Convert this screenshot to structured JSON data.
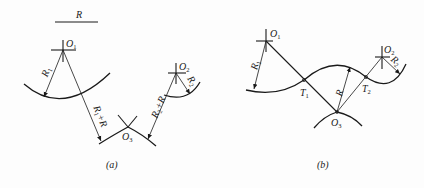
{
  "figure_a": {
    "caption": "(a)",
    "scale_bar_label": "R",
    "labels": {
      "O1": "O",
      "O1_sub": "1",
      "O2": "O",
      "O2_sub": "2",
      "O3": "O",
      "O3_sub": "3",
      "R1": "R",
      "R1_sub": "1",
      "R2": "R",
      "R2_sub": "2",
      "R1pR": "R",
      "R1pR_sub": "1",
      "R1pR_tail": "+R",
      "R2pR": "R",
      "R2pR_sub": "2",
      "R2pR_tail": "+R"
    }
  },
  "figure_b": {
    "caption": "(b)",
    "labels": {
      "O1": "O",
      "O1_sub": "1",
      "O2": "O",
      "O2_sub": "2",
      "O3": "O",
      "O3_sub": "3",
      "T1": "T",
      "T1_sub": "1",
      "T2": "T",
      "T2_sub": "2",
      "R1": "R",
      "R1_sub": "1",
      "R2": "R",
      "R2_sub": "2",
      "R": "R"
    }
  },
  "colors": {
    "ink": "#1a1a1a",
    "background": "#fdfdfd"
  }
}
